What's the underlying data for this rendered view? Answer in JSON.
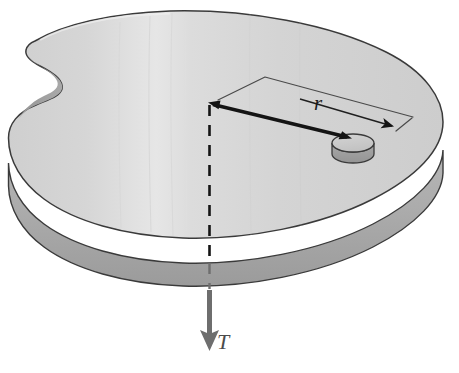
{
  "figure": {
    "type": "physics-free-body-diagram",
    "background_color": "#ffffff"
  },
  "labels": {
    "radius": "r",
    "tension": "T"
  },
  "colors": {
    "disk_top": "#d2d2d2",
    "disk_top_light": "#e2e2e2",
    "disk_rim": "#a9a9a9",
    "disk_rim_dark": "#8f8f8f",
    "notch_shadow": "#9a9a9a",
    "outline": "#2b2b2b",
    "puck_top": "#c9c9c9",
    "puck_side": "#a0a0a0",
    "arrow_black": "#141414",
    "arrow_gray": "#6e6e6e",
    "dimension_line": "#3c3c3c"
  },
  "elements": {
    "disk": {
      "name": "notched-disk",
      "description": "Large horizontal disk drawn in perspective with a concave notch cut into its left edge",
      "center_x": 209,
      "center_y": 135,
      "rim_thickness_px": 23
    },
    "puck": {
      "name": "puck",
      "description": "Small cylindrical puck resting on the disk surface",
      "center_x": 353,
      "center_y": 143,
      "radius_x": 21,
      "radius_y": 9,
      "height_px": 11
    },
    "radius_arrow": {
      "name": "radius-arrow",
      "description": "Thick black arrow from rotation axis to the puck",
      "from_x": 211,
      "from_y": 104,
      "to_x": 350,
      "to_y": 138
    },
    "dimension_line": {
      "name": "radius-dimension-line",
      "description": "Thin leader line with arrowhead indicating the radius r",
      "arrowhead_x": 395,
      "arrowhead_y": 128
    },
    "axis_line": {
      "name": "rotation-axis-dashed-line",
      "description": "Vertical dashed line through the disk centre marking the rotation axis",
      "x": 209,
      "from_y": 105,
      "to_y": 290
    },
    "tension_arrow": {
      "name": "tension-force-arrow",
      "description": "Gray downward arrow below the disk representing the tension force T",
      "x": 209,
      "from_y": 288,
      "to_y": 350
    }
  }
}
